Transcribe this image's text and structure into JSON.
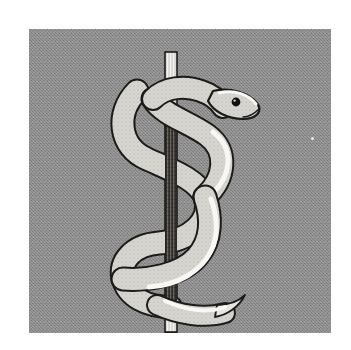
{
  "image": {
    "title": "Rod of Asclepius",
    "subject": "single snake entwined around a staff",
    "medium": "halftone line illustration",
    "canvas": {
      "width": 351,
      "height": 350
    },
    "border": {
      "color": "#ffffff",
      "margin_px": 29
    }
  },
  "panel": {
    "name": "illustration-panel",
    "background_color": "#8a8a8a",
    "texture": "dithered halftone noise",
    "bounds": {
      "x": 29,
      "y": 29,
      "width": 302,
      "height": 304
    }
  },
  "palette": {
    "background_gray": "#8a8a8a",
    "paper_white": "#ffffff",
    "outline_black": "#1a1a1a",
    "snake_body_light": "#d8d6d0",
    "snake_highlight": "#f6f5f2",
    "snake_shadow": "#8f8d87",
    "rod_light": "#f2f1ee",
    "rod_dark": "#3a3733",
    "eye_black": "#111111"
  },
  "elements": {
    "rod": {
      "name": "staff",
      "label": "Rod / staff",
      "top_y": 52,
      "bottom_y": 310,
      "center_x": 172,
      "width_px": 11,
      "upper_section_tone": "light with vertical striations",
      "lower_section_tone": "dark with vertical striations"
    },
    "snake": {
      "name": "serpent",
      "label": "Serpent",
      "coil_count": 3,
      "head": {
        "label": "Snake head",
        "x": 205,
        "y": 98,
        "direction": "facing right and downward",
        "eye": {
          "x": 208,
          "y": 96,
          "radius": 3,
          "color": "#111111"
        }
      },
      "tail": {
        "label": "Snake tail",
        "tip_x": 214,
        "tip_y": 300,
        "direction": "curving right"
      }
    },
    "speck": {
      "name": "paper-speck",
      "x": 311,
      "y": 137,
      "color": "#e9e9e9"
    }
  }
}
